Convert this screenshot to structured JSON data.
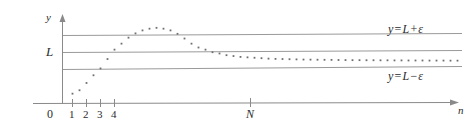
{
  "figure": {
    "width": 471,
    "height": 130
  },
  "axes": {
    "y_axis_label": "y",
    "x_axis_label": "n",
    "origin_label": "0",
    "x_tick_labels": [
      "1",
      "2",
      "3",
      "4"
    ],
    "n_threshold_label": "N",
    "limit_label": "L"
  },
  "annotations": {
    "upper_band_label": "y = L + ε",
    "upper_band_parts": {
      "lhs": "y",
      "eq": "=",
      "rhs_a": "L",
      "op": "+",
      "rhs_b": "ε"
    },
    "lower_band_label": "y = L − ε",
    "lower_band_parts": {
      "lhs": "y",
      "eq": "=",
      "rhs_a": "L",
      "op": "−",
      "rhs_b": "ε"
    }
  },
  "colors": {
    "axis": "#8a8a8a",
    "band": "#9a9a9a",
    "point": "#6f6f6f",
    "text": "#2b2b2b",
    "background": "#ffffff"
  },
  "chart_data": {
    "type": "scatter",
    "title": "",
    "xlabel": "n",
    "ylabel": "y",
    "grid": false,
    "legend": "none",
    "xlim": [
      0,
      58
    ],
    "ylim": [
      0,
      1
    ],
    "reference_lines": [
      {
        "name": "upper",
        "label": "y = L + ε",
        "y": 0.66
      },
      {
        "name": "limit",
        "label": "L",
        "y": 0.5
      },
      {
        "name": "lower",
        "label": "y = L − ε",
        "y": 0.34
      }
    ],
    "markers": [
      {
        "name": "N",
        "x": 27,
        "label": "N"
      }
    ],
    "x": [
      1,
      2,
      3,
      4,
      5,
      6,
      7,
      8,
      9,
      10,
      11,
      12,
      13,
      14,
      15,
      16,
      17,
      18,
      19,
      20,
      21,
      22,
      23,
      24,
      25,
      26,
      27,
      28,
      29,
      30,
      31,
      32,
      33,
      34,
      35,
      36,
      37,
      38,
      39,
      40,
      41,
      42,
      43,
      44,
      45,
      46,
      47,
      48,
      49,
      50,
      51,
      52,
      53,
      54,
      55,
      56
    ],
    "y": [
      0.115,
      0.155,
      0.24,
      0.33,
      0.41,
      0.52,
      0.63,
      0.7,
      0.77,
      0.82,
      0.855,
      0.875,
      0.885,
      0.875,
      0.855,
      0.815,
      0.76,
      0.7,
      0.655,
      0.63,
      0.6,
      0.585,
      0.565,
      0.555,
      0.545,
      0.54,
      0.535,
      0.53,
      0.525,
      0.522,
      0.52,
      0.518,
      0.516,
      0.514,
      0.513,
      0.512,
      0.511,
      0.51,
      0.509,
      0.508,
      0.507,
      0.507,
      0.506,
      0.506,
      0.505,
      0.505,
      0.504,
      0.504,
      0.503,
      0.503,
      0.503,
      0.502,
      0.502,
      0.502,
      0.501,
      0.501
    ]
  }
}
